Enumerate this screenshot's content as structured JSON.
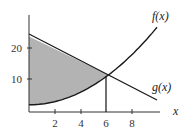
{
  "chart_data": {
    "type": "line",
    "title": "",
    "xlabel": "x",
    "ylabel": "",
    "xlim": [
      0,
      10
    ],
    "ylim": [
      0,
      30
    ],
    "grid": false,
    "legend": "inline labels at curve ends",
    "x_ticks": [
      2,
      4,
      6,
      8
    ],
    "x_tick_labels": [
      "2",
      "4",
      "6",
      "8"
    ],
    "y_ticks": [
      10,
      20
    ],
    "y_tick_labels": [
      "10",
      "20"
    ],
    "series": [
      {
        "name": "f(x)",
        "label": "f(x)",
        "shape": "increasing parabola",
        "x": [
          0,
          1,
          2,
          3,
          4,
          5,
          6,
          7,
          8,
          9,
          10
        ],
        "values": [
          2,
          2.25,
          3,
          4.25,
          6,
          8.25,
          11,
          14.25,
          18,
          22.25,
          27
        ]
      },
      {
        "name": "g(x)",
        "label": "g(x)",
        "shape": "decreasing line",
        "x": [
          0,
          10
        ],
        "values": [
          24,
          4
        ]
      }
    ],
    "annotations": [
      {
        "type": "shaded_region",
        "between": [
          "g(x)",
          "f(x)"
        ],
        "x_from": 0,
        "x_to": 6,
        "color": "#b3b3b3"
      },
      {
        "type": "vertical_line",
        "x": 6,
        "from_y": 0,
        "to_y": 11
      }
    ]
  },
  "labels": {
    "f": "f(x)",
    "g": "g(x)",
    "x_axis": "x",
    "x2": "2",
    "x4": "4",
    "x6": "6",
    "x8": "8",
    "y10": "10",
    "y20": "20"
  },
  "colors": {
    "shade": "#b3b3b3",
    "curve": "#1a1a1a",
    "axis": "#333333"
  }
}
